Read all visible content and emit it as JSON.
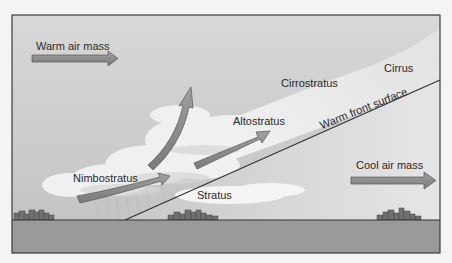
{
  "diagram": {
    "labels": {
      "warm_air_mass": "Warm air mass",
      "cool_air_mass": "Cool air mass",
      "cirrus": "Cirrus",
      "cirrostratus": "Cirrostratus",
      "altostratus": "Altostratus",
      "nimbostratus": "Nimbostratus",
      "stratus": "Stratus",
      "warm_front_surface": "Warm front surface"
    },
    "colors": {
      "sky": "#cfcfcf",
      "ground": "#9a9a9a",
      "frame": "#3a3a3a",
      "arrow_fill": "#8a8a8a",
      "arrow_stroke": "#555555",
      "cloud": "#f2f2f2",
      "buildings": "#6e6e6e"
    }
  }
}
